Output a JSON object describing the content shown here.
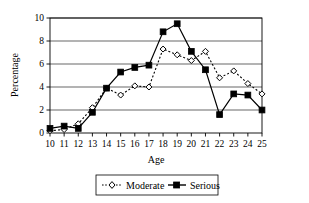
{
  "chart_data": {
    "type": "line",
    "title": "",
    "xlabel": "Age",
    "ylabel": "Percentage",
    "x": [
      10,
      11,
      12,
      13,
      14,
      15,
      16,
      17,
      18,
      19,
      20,
      21,
      22,
      23,
      24,
      25
    ],
    "xtick_labels": [
      "10",
      "11",
      "12",
      "13",
      "14",
      "15",
      "16",
      "17",
      "18",
      "19",
      "20",
      "21",
      "22",
      "23",
      "24",
      "25"
    ],
    "ytick_labels": [
      "0",
      "2",
      "4",
      "6",
      "8",
      "10"
    ],
    "yticks": [
      0,
      2,
      4,
      6,
      8,
      10
    ],
    "xlim": [
      10,
      25
    ],
    "ylim": [
      0,
      10
    ],
    "grid": "horizontal",
    "legend_position": "bottom",
    "series": [
      {
        "name": "Moderate",
        "marker": "open-diamond",
        "linestyle": "dotted",
        "color": "#000000",
        "values": [
          0.2,
          0.3,
          0.8,
          2.2,
          3.9,
          3.3,
          4.1,
          4.0,
          7.3,
          6.8,
          6.3,
          7.1,
          4.8,
          5.4,
          4.3,
          3.4
        ]
      },
      {
        "name": "Serious",
        "marker": "filled-square",
        "linestyle": "solid",
        "color": "#000000",
        "values": [
          0.4,
          0.6,
          0.4,
          1.8,
          3.9,
          5.3,
          5.7,
          5.9,
          8.8,
          9.5,
          7.1,
          5.5,
          1.6,
          3.4,
          3.3,
          2.0
        ]
      }
    ]
  },
  "legend": {
    "items": [
      {
        "label": "Moderate",
        "marker": "open-diamond",
        "linestyle": "dotted"
      },
      {
        "label": "Serious",
        "marker": "filled-square",
        "linestyle": "solid"
      }
    ]
  }
}
